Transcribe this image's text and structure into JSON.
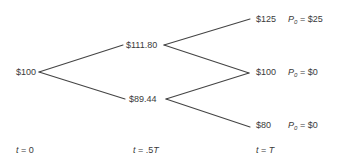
{
  "diagram": {
    "type": "binomial-tree",
    "line_color": "#444444",
    "nodes": {
      "root": {
        "price": "$100"
      },
      "up": {
        "price": "$111.80"
      },
      "down": {
        "price": "$89.44"
      },
      "uu": {
        "price": "$125",
        "payoff_var": "P",
        "payoff_sub": "0",
        "payoff_value": "= $25"
      },
      "ud": {
        "price": "$100",
        "payoff_var": "P",
        "payoff_sub": "0",
        "payoff_value": "= $0"
      },
      "dd": {
        "price": "$80",
        "payoff_var": "P",
        "payoff_sub": "0",
        "payoff_value": "= $0"
      }
    },
    "time_labels": [
      {
        "var": "t",
        "value": " = 0"
      },
      {
        "var": "t",
        "value": " = .5",
        "suffix": "T"
      },
      {
        "var": "t",
        "value": " = ",
        "suffix": "T"
      }
    ]
  }
}
